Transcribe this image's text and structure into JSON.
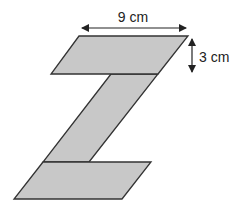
{
  "figure": {
    "fill_color": "#c8c8c8",
    "stroke_color": "#333333",
    "shapes": {
      "top_parallelogram": {
        "points": [
          [
            79,
            36
          ],
          [
            188,
            36
          ],
          [
            158,
            74
          ],
          [
            51,
            74
          ]
        ]
      },
      "middle_strip": {
        "points": [
          [
            111,
            74
          ],
          [
            158,
            74
          ],
          [
            89,
            162
          ],
          [
            43,
            162
          ]
        ]
      },
      "bottom_parallelogram": {
        "points": [
          [
            43,
            162
          ],
          [
            151,
            162
          ],
          [
            122,
            199
          ],
          [
            14,
            199
          ]
        ]
      }
    },
    "dimensions": {
      "width_label": "9 cm",
      "height_label": "3 cm"
    }
  }
}
